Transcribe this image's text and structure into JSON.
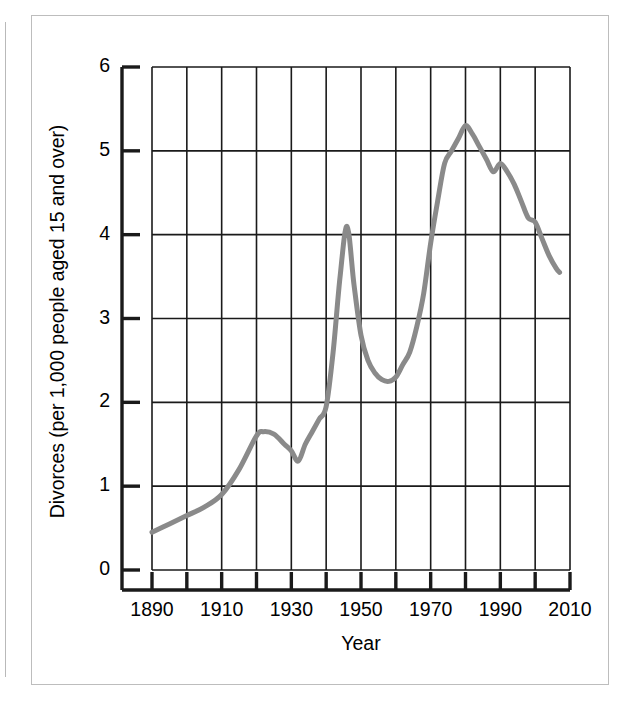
{
  "figure": {
    "kind": "line-chart-figure",
    "background_color": "#ffffff",
    "frame_color": "#bdbdbd"
  },
  "chart_data": {
    "type": "line",
    "title": "",
    "subtitle": "",
    "xlabel": "Year",
    "ylabel": "Divorces (per 1,000 people aged 15 and over)",
    "xlim": [
      1890,
      2010
    ],
    "ylim": [
      0,
      6
    ],
    "grid": true,
    "grid_x_step": 10,
    "grid_y_step": 1,
    "legend": "none",
    "line_color": "#8a8a8a",
    "line_width": 5,
    "axis_color": "#1a1a1a",
    "x_tick_labels": [
      "1890",
      "1910",
      "1930",
      "1950",
      "1970",
      "1990",
      "2010"
    ],
    "x_tick_label_values": [
      1890,
      1910,
      1930,
      1950,
      1970,
      1990,
      2010
    ],
    "x_minor_ticks": [
      1890,
      1900,
      1910,
      1920,
      1930,
      1940,
      1950,
      1960,
      1970,
      1980,
      1990,
      2000,
      2010
    ],
    "y_tick_labels": [
      "0",
      "1",
      "2",
      "3",
      "4",
      "5",
      "6"
    ],
    "y_tick_label_values": [
      0,
      1,
      2,
      3,
      4,
      5,
      6
    ],
    "series": [
      {
        "name": "Divorce rate",
        "x": [
          1890,
          1895,
          1900,
          1905,
          1910,
          1915,
          1920,
          1922,
          1925,
          1928,
          1930,
          1932,
          1934,
          1936,
          1938,
          1940,
          1942,
          1944,
          1946,
          1948,
          1950,
          1952,
          1954,
          1956,
          1958,
          1960,
          1962,
          1964,
          1966,
          1968,
          1970,
          1972,
          1974,
          1976,
          1978,
          1980,
          1982,
          1984,
          1986,
          1988,
          1990,
          1992,
          1994,
          1996,
          1998,
          2000,
          2002,
          2004,
          2006,
          2007
        ],
        "y": [
          0.45,
          0.55,
          0.65,
          0.75,
          0.9,
          1.2,
          1.6,
          1.65,
          1.62,
          1.5,
          1.42,
          1.3,
          1.5,
          1.65,
          1.8,
          1.95,
          2.6,
          3.5,
          4.1,
          3.4,
          2.8,
          2.5,
          2.35,
          2.27,
          2.25,
          2.3,
          2.45,
          2.6,
          2.9,
          3.3,
          3.9,
          4.4,
          4.85,
          5.0,
          5.15,
          5.3,
          5.2,
          5.05,
          4.9,
          4.75,
          4.85,
          4.75,
          4.6,
          4.4,
          4.2,
          4.15,
          3.95,
          3.75,
          3.6,
          3.55
        ]
      }
    ],
    "annotations": [
      {
        "label": "1890 starting value",
        "x": 1890,
        "y": 0.45
      },
      {
        "label": "post-WWI peak",
        "x": 1922,
        "y": 1.65
      },
      {
        "label": "Depression-era low",
        "x": 1932,
        "y": 1.3
      },
      {
        "label": "post-WWII peak",
        "x": 1946,
        "y": 4.1
      },
      {
        "label": "1950s trough",
        "x": 1958,
        "y": 2.25
      },
      {
        "label": "all-time peak",
        "x": 1980,
        "y": 5.3
      },
      {
        "label": "final value",
        "x": 2007,
        "y": 3.55
      }
    ]
  }
}
